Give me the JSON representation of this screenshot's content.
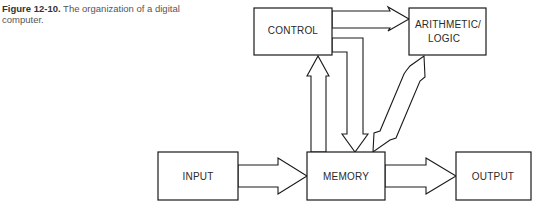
{
  "caption": {
    "figure_label": "Figure 12-10.",
    "text": " The organization of a digital computer."
  },
  "diagram": {
    "nodes": [
      {
        "id": "control",
        "label": "CONTROL"
      },
      {
        "id": "arithmetic_logic",
        "label_line1": "ARITHMETIC/",
        "label_line2": "LOGIC"
      },
      {
        "id": "input",
        "label": "INPUT"
      },
      {
        "id": "memory",
        "label": "MEMORY"
      },
      {
        "id": "output",
        "label": "OUTPUT"
      }
    ],
    "edges": [
      {
        "from": "control",
        "to": "arithmetic_logic",
        "style": "hollow-arrow"
      },
      {
        "from": "control",
        "to": "memory",
        "style": "hollow-arrow"
      },
      {
        "from": "memory",
        "to": "control",
        "style": "hollow-arrow"
      },
      {
        "from": "memory",
        "to": "arithmetic_logic",
        "style": "double-hollow-arrow"
      },
      {
        "from": "input",
        "to": "memory",
        "style": "hollow-arrow"
      },
      {
        "from": "memory",
        "to": "output",
        "style": "hollow-arrow"
      }
    ]
  }
}
